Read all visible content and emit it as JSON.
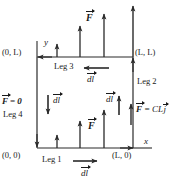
{
  "figure": {
    "stroke_color": "#2a2a2a",
    "text_color": "#1a1a1a",
    "background": "#ffffff"
  },
  "axes": {
    "x_label": "x",
    "y_label": "y"
  },
  "corners": [
    {
      "name": "origin",
      "label": "(0, 0)"
    },
    {
      "name": "bottom-right",
      "label": "(L, 0)"
    },
    {
      "name": "top-left",
      "label": "(0, L)"
    },
    {
      "name": "top-right",
      "label": "(L, L)"
    }
  ],
  "legs": [
    {
      "name": "leg-1",
      "label": "Leg 1",
      "dl_label": "dl",
      "dl_direction": "right",
      "force_label": "F",
      "force_direction": "up"
    },
    {
      "name": "leg-2",
      "label": "Leg 2",
      "dl_label": "dl",
      "dl_direction": "up",
      "force_label": "F = CL j",
      "force_direction": "up"
    },
    {
      "name": "leg-3",
      "label": "Leg 3",
      "dl_label": "dl",
      "dl_direction": "left",
      "force_label": "F",
      "force_direction": "up"
    },
    {
      "name": "leg-4",
      "label": "Leg 4",
      "dl_label": "dl",
      "dl_direction": "down",
      "force_label": "F = 0",
      "force_direction": "none"
    }
  ],
  "symbols": {
    "F": "F",
    "dl": "dl",
    "zero": "0",
    "equals": "=",
    "CL": "CL",
    "j": "j"
  }
}
